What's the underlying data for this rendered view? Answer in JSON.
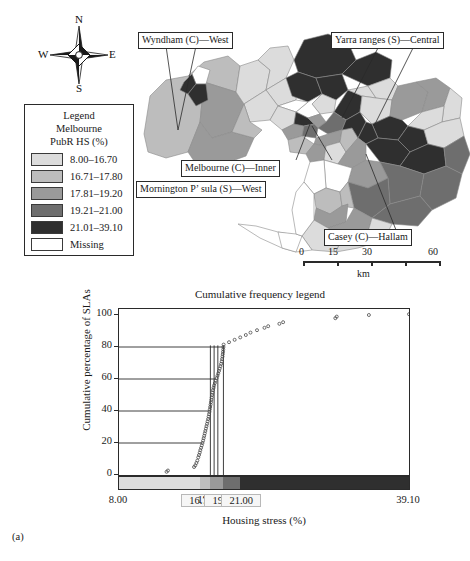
{
  "figure": {
    "id_label": "(a)"
  },
  "compass": {
    "north": "N",
    "south": "S",
    "west": "W",
    "east": "E"
  },
  "legend": {
    "title_lines": [
      "Legend",
      "Melbourne",
      "PubR HS (%)"
    ],
    "items": [
      {
        "label": "8.00–16.70",
        "color": "#dcdcdc"
      },
      {
        "label": "16.71–17.80",
        "color": "#bdbdbd"
      },
      {
        "label": "17.81–19.20",
        "color": "#9a9a9a"
      },
      {
        "label": "19.21–21.00",
        "color": "#6e6e6e"
      },
      {
        "label": "21.01–39.10",
        "color": "#2f2f2f"
      },
      {
        "label": "Missing",
        "color": "#ffffff"
      }
    ]
  },
  "map": {
    "callouts": [
      {
        "name": "wyndham",
        "text": "Wyndham (C)—West"
      },
      {
        "name": "yarra",
        "text": "Yarra ranges (S)—Central"
      },
      {
        "name": "melbourne",
        "text": "Melbourne (C)—Inner"
      },
      {
        "name": "mornington",
        "text": "Mornington P’ sula (S)—West"
      },
      {
        "name": "casey",
        "text": "Casey (C)—Hallam"
      }
    ],
    "scalebar": {
      "ticks": [
        "0",
        "15",
        "30",
        "60"
      ],
      "unit": "km"
    }
  },
  "chart_data": {
    "type": "line",
    "title": "Cumulative frequency legend",
    "xlabel": "Housing stress (%)",
    "ylabel": "Cumulative percentage of SLAs",
    "xlim": [
      8.0,
      39.1
    ],
    "ylim": [
      0,
      100
    ],
    "grid": "horizontal-partial",
    "legend": "none",
    "xticks": [
      {
        "value": 8.0,
        "label": "8.00",
        "boxed": false
      },
      {
        "value": 16.7,
        "label": "16.70",
        "boxed": true
      },
      {
        "value": 17.8,
        "label": "17.80",
        "boxed": false
      },
      {
        "value": 19.2,
        "label": "19.20",
        "boxed": true
      },
      {
        "value": 21.0,
        "label": "21.00",
        "boxed": true
      },
      {
        "value": 39.1,
        "label": "39.10",
        "boxed": false
      }
    ],
    "yticks": [
      0,
      20,
      40,
      60,
      80,
      100
    ],
    "class_breaks": [
      {
        "from": 8.0,
        "to": 16.7,
        "color": "#dcdcdc",
        "cum_pct": 2
      },
      {
        "from": 16.71,
        "to": 17.8,
        "color": "#bdbdbd",
        "cum_pct": 40
      },
      {
        "from": 17.81,
        "to": 19.2,
        "color": "#9a9a9a",
        "cum_pct": 61
      },
      {
        "from": 19.21,
        "to": 21.0,
        "color": "#6e6e6e",
        "cum_pct": 81
      },
      {
        "from": 21.01,
        "to": 39.1,
        "color": "#2f2f2f",
        "cum_pct": 100
      }
    ],
    "series": [
      {
        "name": "Cumulative percentage of SLAs",
        "marker": "open-circle",
        "points": [
          [
            13.1,
            2.0
          ],
          [
            13.25,
            2.8
          ],
          [
            16.05,
            5.0
          ],
          [
            16.18,
            6.0
          ],
          [
            16.3,
            7.5
          ],
          [
            16.4,
            9.0
          ],
          [
            16.5,
            11.0
          ],
          [
            16.58,
            12.5
          ],
          [
            16.66,
            14.0
          ],
          [
            16.72,
            15.5
          ],
          [
            16.8,
            17.0
          ],
          [
            16.88,
            18.5
          ],
          [
            16.95,
            20.0
          ],
          [
            17.02,
            21.5
          ],
          [
            17.08,
            23.0
          ],
          [
            17.14,
            24.5
          ],
          [
            17.2,
            26.0
          ],
          [
            17.26,
            27.5
          ],
          [
            17.32,
            29.0
          ],
          [
            17.38,
            30.5
          ],
          [
            17.44,
            32.0
          ],
          [
            17.5,
            33.5
          ],
          [
            17.56,
            35.0
          ],
          [
            17.61,
            36.5
          ],
          [
            17.66,
            38.0
          ],
          [
            17.7,
            39.5
          ],
          [
            17.74,
            41.0
          ],
          [
            17.78,
            42.5
          ],
          [
            17.82,
            44.0
          ],
          [
            17.86,
            45.5
          ],
          [
            17.9,
            47.0
          ],
          [
            17.94,
            48.5
          ],
          [
            17.98,
            50.0
          ],
          [
            18.03,
            51.5
          ],
          [
            18.08,
            53.0
          ],
          [
            18.14,
            54.5
          ],
          [
            18.2,
            56.0
          ],
          [
            18.28,
            57.5
          ],
          [
            18.36,
            59.0
          ],
          [
            18.46,
            60.5
          ],
          [
            18.56,
            62.0
          ],
          [
            18.64,
            63.5
          ],
          [
            18.72,
            65.0
          ],
          [
            18.8,
            66.5
          ],
          [
            18.88,
            68.0
          ],
          [
            18.95,
            69.5
          ],
          [
            19.02,
            71.0
          ],
          [
            19.06,
            72.5
          ],
          [
            19.1,
            74.0
          ],
          [
            19.13,
            75.5
          ],
          [
            19.16,
            77.0
          ],
          [
            19.18,
            78.5
          ],
          [
            19.2,
            80.0
          ],
          [
            19.22,
            81.5
          ],
          [
            19.8,
            83.0
          ],
          [
            20.4,
            84.5
          ],
          [
            21.0,
            86.0
          ],
          [
            21.6,
            87.5
          ],
          [
            22.1,
            89.0
          ],
          [
            22.8,
            90.5
          ],
          [
            23.6,
            92.0
          ],
          [
            24.0,
            93.0
          ],
          [
            25.2,
            94.5
          ],
          [
            25.6,
            95.5
          ],
          [
            31.2,
            98.0
          ],
          [
            31.35,
            99.0
          ],
          [
            34.8,
            100.0
          ],
          [
            39.1,
            100.5
          ]
        ]
      }
    ],
    "reference_lines": [
      {
        "x": 17.8,
        "y_top": 81
      },
      {
        "x": 18.2,
        "y_top": 81
      },
      {
        "x": 18.6,
        "y_top": 81
      },
      {
        "x": 19.2,
        "y_top": 81
      }
    ],
    "hlines": [
      20,
      40,
      60,
      80
    ]
  }
}
